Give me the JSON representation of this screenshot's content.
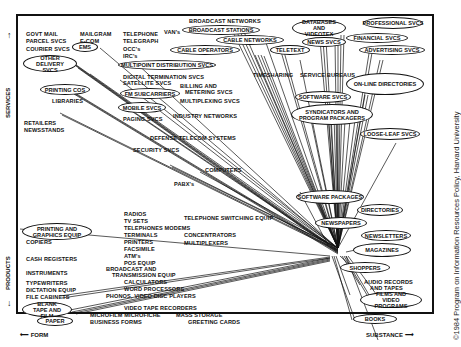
{
  "axes": {
    "y_label": "SERVICES",
    "y_label_bottom": "PRODUCTS",
    "x_label_left": "FORM",
    "x_label_right": "SUBSTANCE"
  },
  "copyright": "©1984 Program on Information Resources Policy, Harvard University",
  "labels": {
    "govt_mail": "GOVT MAIL",
    "parcel_svcs": "PARCEL SVCS",
    "courier_svcs": "COURIER SVCS",
    "mailgram": "MAILGRAM",
    "ecom": "E-COM",
    "telephone": "TELEPHONE",
    "telegraph": "TELEGRAPH",
    "occs": "OCC's",
    "ircs": "IRC's",
    "vans": "VAN's",
    "broadcast_networks": "BROADCAST NETWORKS",
    "digital_termination": "DIGITAL TERMINATION SVCS",
    "satellite_svcs": "SATELLITE SVCS",
    "billing_metering_1": "BILLING AND",
    "billing_metering_2": "METERING SVCS",
    "multiplexing_svcs": "MULTIPLEXING SVCS",
    "libraries": "LIBRARIES",
    "paging_svcs": "PAGING SVCS",
    "industry_networks": "INDUSTRY NETWORKS",
    "retailers": "RETAILERS",
    "newsstands": "NEWSSTANDS",
    "defense_telecom": "DEFENSE TELECOM SYSTEMS",
    "security_svcs": "SECURITY SVCS",
    "computers": "COMPUTERS",
    "pabxs": "PABX's",
    "timesharing": "TIMESHARING",
    "service_bureaus": "SERVICE BUREAUS",
    "radios": "RADIOS",
    "tv_sets": "TV SETS",
    "telephones_modems": "TELEPHONES  MODEMS",
    "terminals": "TERMINALS",
    "printers": "PRINTERS",
    "facsimile": "FACSIMILE",
    "atms": "ATM's",
    "pos_equip": "POS EQUIP",
    "broadcast_and": "BROADCAST AND",
    "transmission_equip": "TRANSMISSION EQUIP",
    "calculators": "CALCULATORS",
    "word_processors": "WORD PROCESSORS",
    "phono_video": "PHONOS, VIDEO DISC PLAYERS",
    "video_tape_recorders": "VIDEO TAPE RECORDERS",
    "microfilm": "MICROFILM MICROFICHE",
    "business_forms": "BUSINESS FORMS",
    "mass_storage": "MASS STORAGE",
    "greeting_cards": "GREETING CARDS",
    "telephone_switching": "TELEPHONE SWITCHING EQUIP",
    "concentrators": "CONCENTRATORS",
    "multiplexers": "MULTIPLEXERS",
    "copiers": "COPIERS",
    "cash_registers": "CASH REGISTERS",
    "instruments": "INSTRUMENTS",
    "typewriters": "TYPEWRITERS",
    "dictation_equip": "DICTATION EQUIP",
    "file_cabinets": "FILE CABINETS",
    "audio_records_1": "AUDIO RECORDS",
    "audio_records_2": "AND TAPES"
  },
  "ovals": {
    "ems": "EMS",
    "other_delivery": "OTHER DELIVERY SVCS",
    "printing_cos": "PRINTING COS",
    "mobile_svcs": "MOBILE SVCS",
    "fm_subcarriers": "FM SUBCARRIERS",
    "multipoint": "MULTIPOINT DISTRIBUTION SVCS",
    "broadcast_stations": "BROADCAST STATIONS",
    "cable_networks": "CABLE NETWORKS",
    "cable_operators": "CABLE OPERATORS",
    "teletext": "TELETEXT",
    "databases": "DATABASES AND VIDEOTEX",
    "news_svcs": "NEWS SVCS",
    "professional_svcs": "PROFESSIONAL SVCS",
    "financial_svcs": "FINANCIAL SVCS",
    "advertising_svcs": "ADVERTISING SVCS",
    "online_directories": "ON-LINE DIRECTORIES",
    "software_svcs": "SOFTWARE SVCS",
    "syndicators": "SYNDICATORS AND PROGRAM PACKAGERS",
    "loose_leaf": "LOOSE-LEAF SVCS",
    "software_packages": "SOFTWARE PACKAGES",
    "directories": "DIRECTORIES",
    "newspapers": "NEWSPAPERS",
    "newsletters": "NEWSLETTERS",
    "magazines": "MAGAZINES",
    "shoppers": "SHOPPERS",
    "films_video": "FILMS AND VIDEO PROGRAMS",
    "books": "BOOKS",
    "printing_graphics": "PRINTING AND GRAPHICS EQUIP",
    "blank_tape": "BLANK TAPE AND FILM",
    "paper": "PAPER"
  }
}
